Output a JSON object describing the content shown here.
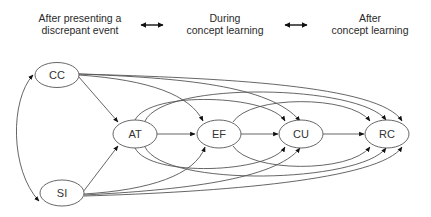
{
  "header": {
    "stages": [
      {
        "line1": "After presenting a",
        "line2": "discrepant event"
      },
      {
        "line1": "During",
        "line2": "concept learning"
      },
      {
        "line1": "After",
        "line2": "concept learning"
      }
    ],
    "connectors": [
      "bidirectional-arrow",
      "bidirectional-arrow"
    ]
  },
  "diagram": {
    "nodes": [
      {
        "id": "CC",
        "label": "CC"
      },
      {
        "id": "SI",
        "label": "SI"
      },
      {
        "id": "AT",
        "label": "AT"
      },
      {
        "id": "EF",
        "label": "EF"
      },
      {
        "id": "CU",
        "label": "CU"
      },
      {
        "id": "RC",
        "label": "RC"
      }
    ],
    "edges": [
      {
        "from": "CC",
        "to": "SI",
        "type": "bidirectional"
      },
      {
        "from": "CC",
        "to": "AT"
      },
      {
        "from": "CC",
        "to": "EF"
      },
      {
        "from": "CC",
        "to": "CU"
      },
      {
        "from": "CC",
        "to": "RC"
      },
      {
        "from": "SI",
        "to": "AT"
      },
      {
        "from": "SI",
        "to": "EF"
      },
      {
        "from": "SI",
        "to": "CU"
      },
      {
        "from": "SI",
        "to": "RC"
      },
      {
        "from": "AT",
        "to": "EF"
      },
      {
        "from": "AT",
        "to": "CU"
      },
      {
        "from": "AT",
        "to": "RC"
      },
      {
        "from": "EF",
        "to": "CU"
      },
      {
        "from": "EF",
        "to": "RC"
      },
      {
        "from": "CU",
        "to": "RC"
      }
    ]
  }
}
